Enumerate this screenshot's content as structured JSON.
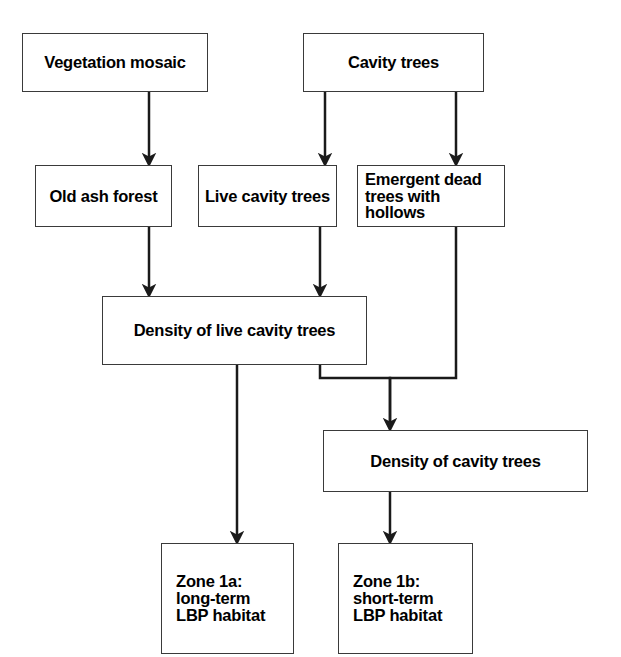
{
  "diagram": {
    "type": "flowchart",
    "orientation": "top-to-bottom",
    "background_color": "#ffffff",
    "node_fill_color": "#ffffff",
    "node_border_color": "#3a3a3a",
    "edge_color": "#1a1a1a",
    "text_color": "#000000",
    "nodes": [
      {
        "id": "vegetation-mosaic",
        "label": "Vegetation mosaic",
        "x": 22,
        "y": 33,
        "width": 186,
        "height": 59,
        "font_size": 16.5,
        "align": "center",
        "padding_left": 0
      },
      {
        "id": "cavity-trees",
        "label": "Cavity trees",
        "x": 303,
        "y": 33,
        "width": 181,
        "height": 59,
        "font_size": 16.5,
        "align": "center",
        "padding_left": 0
      },
      {
        "id": "old-ash-forest",
        "label": "Old ash forest",
        "x": 35,
        "y": 165,
        "width": 137,
        "height": 62,
        "font_size": 16.5,
        "align": "center",
        "padding_left": 0
      },
      {
        "id": "live-cavity-trees",
        "label": "Live cavity trees",
        "x": 198,
        "y": 165,
        "width": 139,
        "height": 62,
        "font_size": 16.5,
        "align": "center",
        "padding_left": 0
      },
      {
        "id": "emergent-dead-trees-with-hollows",
        "label": "Emergent dead\ntrees with hollows",
        "x": 357,
        "y": 165,
        "width": 148,
        "height": 62,
        "font_size": 16.5,
        "align": "left",
        "padding_left": 7
      },
      {
        "id": "density-of-live-cavity-trees",
        "label": "Density of live cavity trees",
        "x": 102,
        "y": 296,
        "width": 265,
        "height": 69,
        "font_size": 16.5,
        "align": "center",
        "padding_left": 0
      },
      {
        "id": "density-of-cavity-trees",
        "label": "Density of cavity trees",
        "x": 323,
        "y": 430,
        "width": 265,
        "height": 62,
        "font_size": 16.5,
        "align": "center",
        "padding_left": 0
      },
      {
        "id": "zone-1a",
        "label": "Zone 1a:\nlong-term\nLBP habitat",
        "x": 161,
        "y": 543,
        "width": 133,
        "height": 111,
        "font_size": 16.5,
        "align": "left",
        "padding_left": 14
      },
      {
        "id": "zone-1b",
        "label": "Zone 1b:\nshort-term\nLBP habitat",
        "x": 338,
        "y": 543,
        "width": 135,
        "height": 111,
        "font_size": 16.5,
        "align": "left",
        "padding_left": 14
      }
    ],
    "edges": [
      {
        "id": "edge-vegetation-to-old-ash",
        "from": "vegetation-mosaic",
        "to": "old-ash-forest",
        "path": "M 149 92 L 149 160",
        "arrowhead": true
      },
      {
        "id": "edge-cavity-to-live-cavity",
        "from": "cavity-trees",
        "to": "live-cavity-trees",
        "path": "M 325 92 L 325 160",
        "arrowhead": true
      },
      {
        "id": "edge-cavity-to-emergent-dead",
        "from": "cavity-trees",
        "to": "emergent-dead-trees-with-hollows",
        "path": "M 456 92 L 456 160",
        "arrowhead": true
      },
      {
        "id": "edge-old-ash-to-density-live",
        "from": "old-ash-forest",
        "to": "density-of-live-cavity-trees",
        "path": "M 149 227 L 149 291",
        "arrowhead": true
      },
      {
        "id": "edge-live-cavity-to-density-live",
        "from": "live-cavity-trees",
        "to": "density-of-live-cavity-trees",
        "path": "M 320 227 L 320 291",
        "arrowhead": true
      },
      {
        "id": "edge-density-live-to-zone-1a",
        "from": "density-of-live-cavity-trees",
        "to": "zone-1a",
        "path": "M 237 365 L 237 538",
        "arrowhead": true
      },
      {
        "id": "edge-density-live-to-density-cavity",
        "from": "density-of-live-cavity-trees",
        "to": "density-of-cavity-trees",
        "path": "M 320 365 L 320 378 L 390 378 L 390 425",
        "arrowhead": true
      },
      {
        "id": "edge-emergent-dead-to-density-cavity",
        "from": "emergent-dead-trees-with-hollows",
        "to": "density-of-cavity-trees",
        "path": "M 456 227 L 456 378 L 390 378 L 390 425",
        "arrowhead": false
      },
      {
        "id": "edge-density-cavity-to-zone-1b",
        "from": "density-of-cavity-trees",
        "to": "zone-1b",
        "path": "M 390 492 L 390 538",
        "arrowhead": true
      }
    ]
  }
}
